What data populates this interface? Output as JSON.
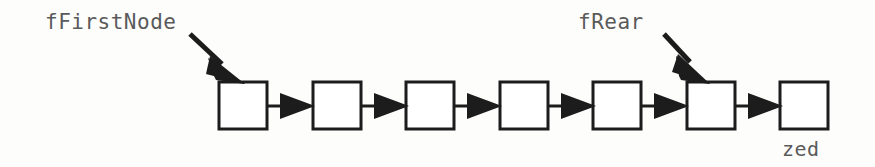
{
  "diagram": {
    "type": "linked-list",
    "title": "",
    "background_color": "#fdfdfc",
    "stroke_color": "#1c1c1c",
    "text_color": "#5a5a5a",
    "labels": {
      "first_node": "fFirstNode",
      "rear": "fRear",
      "zed": "zed"
    },
    "node_count": 7,
    "nodes": [
      {
        "index": 0,
        "x": 219,
        "y": 82,
        "width": 48,
        "height": 47,
        "pointed_by": "fFirstNode"
      },
      {
        "index": 1,
        "x": 313,
        "y": 82,
        "width": 48,
        "height": 47,
        "pointed_by": ""
      },
      {
        "index": 2,
        "x": 406,
        "y": 82,
        "width": 48,
        "height": 47,
        "pointed_by": ""
      },
      {
        "index": 3,
        "x": 500,
        "y": 82,
        "width": 48,
        "height": 47,
        "pointed_by": ""
      },
      {
        "index": 4,
        "x": 593,
        "y": 82,
        "width": 48,
        "height": 47,
        "pointed_by": ""
      },
      {
        "index": 5,
        "x": 687,
        "y": 82,
        "width": 48,
        "height": 47,
        "pointed_by": "fRear"
      },
      {
        "index": 6,
        "x": 780,
        "y": 82,
        "width": 48,
        "height": 47,
        "pointed_by": "",
        "caption": "zed"
      }
    ],
    "link_arrows": [
      {
        "from_node": 0,
        "to_node": 1,
        "x1": 267,
        "x2": 313,
        "y": 106
      },
      {
        "from_node": 1,
        "to_node": 2,
        "x1": 361,
        "x2": 406,
        "y": 106
      },
      {
        "from_node": 2,
        "to_node": 3,
        "x1": 454,
        "x2": 500,
        "y": 106
      },
      {
        "from_node": 3,
        "to_node": 4,
        "x1": 548,
        "x2": 593,
        "y": 106
      },
      {
        "from_node": 4,
        "to_node": 5,
        "x1": 641,
        "x2": 687,
        "y": 106
      },
      {
        "from_node": 5,
        "to_node": 6,
        "x1": 735,
        "x2": 780,
        "y": 106
      }
    ],
    "pointer_arrows": [
      {
        "label": "fFirstNode",
        "x1": 190,
        "y1": 34,
        "x2": 243,
        "y2": 82
      },
      {
        "label": "fRear",
        "x1": 664,
        "y1": 34,
        "x2": 708,
        "y2": 82
      }
    ]
  }
}
